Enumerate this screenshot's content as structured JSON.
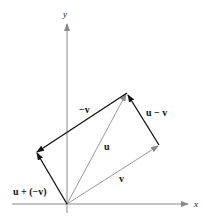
{
  "diagram": {
    "axes": {
      "x_label": "x",
      "y_label": "y",
      "color": "#8a8a8a"
    },
    "vectors": [
      {
        "id": "u",
        "label": "u",
        "color": "#9a9a9a"
      },
      {
        "id": "v",
        "label": "v",
        "color": "#9a9a9a"
      },
      {
        "id": "neg_v",
        "label": "−v",
        "color": "#111111"
      },
      {
        "id": "u_minus_v",
        "label": "u − v",
        "color": "#111111"
      },
      {
        "id": "u_plus_neg_v",
        "label": "u + (−v)",
        "color": "#111111"
      }
    ]
  }
}
